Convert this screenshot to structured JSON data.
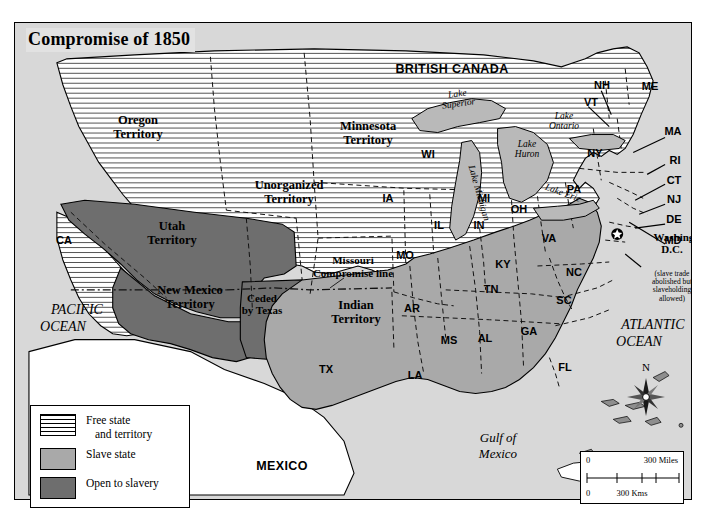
{
  "title": "Compromise of 1850",
  "countries": [
    {
      "name": "BRITISH CANADA",
      "x": 437,
      "y": 68
    },
    {
      "name": "MEXICO",
      "x": 281,
      "y": 465
    }
  ],
  "oceans": [
    {
      "name": "PACIFIC",
      "name2": "OCEAN",
      "x": 52,
      "y": 318
    },
    {
      "name": "ATLANTIC",
      "name2": "OCEAN",
      "x": 629,
      "y": 330
    }
  ],
  "waters": [
    {
      "name": "Lake\nSuperior",
      "x": 444,
      "y": 98,
      "rot": -10
    },
    {
      "name": "Lake\nMichigan",
      "x": 463,
      "y": 168,
      "rot": 72
    },
    {
      "name": "Lake\nHuron",
      "x": 513,
      "y": 145,
      "rot": 0
    },
    {
      "name": "Lake\nOntario",
      "x": 551,
      "y": 117,
      "rot": 0
    },
    {
      "name": "Lake Erie",
      "x": 542,
      "y": 180,
      "rot": 22
    }
  ],
  "gulf": {
    "name": "Gulf of\nMexico",
    "x": 482,
    "y": 441
  },
  "territories": [
    {
      "name": "Oregon\nTerritory",
      "x": 123,
      "y": 125,
      "fill": "free"
    },
    {
      "name": "Utah\nTerritory",
      "x": 157,
      "y": 231,
      "fill": "open"
    },
    {
      "name": "New Mexico\nTerritory",
      "x": 173,
      "y": 296,
      "fill": "open"
    },
    {
      "name": "Ceded\nby Texas",
      "x": 247,
      "y": 303,
      "fill": "open"
    },
    {
      "name": "Unorganized\nTerritory",
      "x": 274,
      "y": 190,
      "fill": "free"
    },
    {
      "name": "Minnesota\nTerritory",
      "x": 353,
      "y": 131,
      "fill": "free"
    },
    {
      "name": "Indian\nTerritory",
      "x": 341,
      "y": 310,
      "fill": "plain"
    }
  ],
  "missouri_line_label": "Missouri\nCompromise line",
  "washington": {
    "title": "Washington,\nD.C.",
    "note": "(slave trade\nabolished but\nslaveholding\nallowed)",
    "x": 658,
    "y": 268
  },
  "states": [
    {
      "abbr": "CA",
      "x": 63,
      "y": 239,
      "fill": "free"
    },
    {
      "abbr": "WI",
      "x": 427,
      "y": 153,
      "fill": "free"
    },
    {
      "abbr": "MI",
      "x": 483,
      "y": 197,
      "fill": "free"
    },
    {
      "abbr": "IA",
      "x": 387,
      "y": 197,
      "fill": "free"
    },
    {
      "abbr": "IL",
      "x": 438,
      "y": 224,
      "fill": "free"
    },
    {
      "abbr": "IN",
      "x": 478,
      "y": 224,
      "fill": "free"
    },
    {
      "abbr": "OH",
      "x": 518,
      "y": 208,
      "fill": "free"
    },
    {
      "abbr": "PA",
      "x": 573,
      "y": 188,
      "fill": "free"
    },
    {
      "abbr": "NY",
      "x": 594,
      "y": 152,
      "fill": "free"
    },
    {
      "abbr": "NH",
      "x": 601,
      "y": 84,
      "fill": "free"
    },
    {
      "abbr": "ME",
      "x": 649,
      "y": 85,
      "fill": "free"
    },
    {
      "abbr": "VT",
      "x": 590,
      "y": 101,
      "fill": "free"
    },
    {
      "abbr": "MA",
      "x": 667,
      "y": 130,
      "fill": "free"
    },
    {
      "abbr": "RI",
      "x": 669,
      "y": 159,
      "fill": "free"
    },
    {
      "abbr": "CT",
      "x": 668,
      "y": 179,
      "fill": "free"
    },
    {
      "abbr": "NJ",
      "x": 667,
      "y": 198,
      "fill": "free"
    },
    {
      "abbr": "DE",
      "x": 667,
      "y": 218,
      "fill": "slave"
    },
    {
      "abbr": "MD",
      "x": 666,
      "y": 239,
      "fill": "slave"
    },
    {
      "abbr": "MO",
      "x": 404,
      "y": 254,
      "fill": "slave"
    },
    {
      "abbr": "AR",
      "x": 411,
      "y": 307,
      "fill": "slave"
    },
    {
      "abbr": "KY",
      "x": 502,
      "y": 263,
      "fill": "slave"
    },
    {
      "abbr": "TN",
      "x": 490,
      "y": 288,
      "fill": "slave"
    },
    {
      "abbr": "VA",
      "x": 548,
      "y": 237,
      "fill": "slave"
    },
    {
      "abbr": "NC",
      "x": 573,
      "y": 271,
      "fill": "slave"
    },
    {
      "abbr": "SC",
      "x": 563,
      "y": 299,
      "fill": "slave"
    },
    {
      "abbr": "MS",
      "x": 448,
      "y": 339,
      "fill": "slave"
    },
    {
      "abbr": "AL",
      "x": 484,
      "y": 337,
      "fill": "slave"
    },
    {
      "abbr": "GA",
      "x": 528,
      "y": 330,
      "fill": "slave"
    },
    {
      "abbr": "FL",
      "x": 564,
      "y": 366,
      "fill": "slave"
    },
    {
      "abbr": "LA",
      "x": 414,
      "y": 374,
      "fill": "slave"
    },
    {
      "abbr": "TX",
      "x": 325,
      "y": 368,
      "fill": "slave"
    }
  ],
  "legend": {
    "items": [
      {
        "label": "Free state",
        "label2": "and territory",
        "swatch": "free"
      },
      {
        "label": "Slave state",
        "label2": "",
        "swatch": "slave"
      },
      {
        "label": "Open to slavery",
        "label2": "",
        "swatch": "open"
      }
    ]
  },
  "scalebar": {
    "miles_zero": "0",
    "miles_label": "300 Miles",
    "kms_zero": "0",
    "kms_label": "300 Kms"
  },
  "compass": {
    "north": "N"
  },
  "colors": {
    "slave_state": "#a9a9a9",
    "open_to_slavery": "#6e6e6e",
    "water": "#d8d8d8",
    "land_plain": "#ffffff",
    "border": "#000000"
  }
}
